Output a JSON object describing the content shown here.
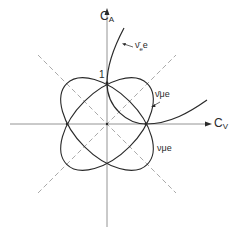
{
  "diagram": {
    "axes": {
      "vertical": {
        "label": "C",
        "subscript": "A"
      },
      "horizontal": {
        "label": "C",
        "subscript": "V"
      }
    },
    "tick_label": "1",
    "curves": [
      {
        "name": "nu-bar-e-e",
        "label": "ν̄ₑe",
        "label_text": "ν̄",
        "sub": "e",
        "suffix": "e"
      },
      {
        "name": "nu-bar-mu-e",
        "label": "ν̄μe",
        "label_text": "ν̄",
        "sub": "μ",
        "suffix": "e"
      },
      {
        "name": "nu-mu-e",
        "label": "νμe",
        "label_text": "ν",
        "sub": "μ",
        "suffix": "e"
      }
    ],
    "colors": {
      "line": "#2a2a2a",
      "dashed": "#aaaaaa",
      "axis": "#888888"
    }
  }
}
